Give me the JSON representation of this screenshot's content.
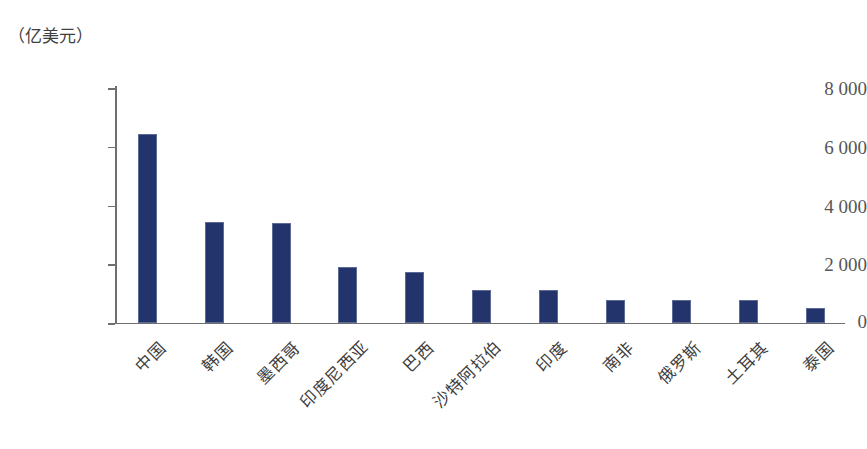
{
  "chart_data": {
    "type": "bar",
    "title": "",
    "subtitle": "",
    "unit_label": "（亿美元）",
    "xlabel": "",
    "ylabel": "",
    "ylim": [
      0,
      8000
    ],
    "yticks": [
      "0",
      "2 000",
      "4 000",
      "6 000",
      "8 000"
    ],
    "ytick_values": [
      0,
      2000,
      4000,
      6000,
      8000
    ],
    "grid": false,
    "legend": false,
    "bar_color": "#22346b",
    "axis_color": "#6f6f6f",
    "categories": [
      "中国",
      "韩国",
      "墨西哥",
      "印度尼西亚",
      "巴西",
      "沙特阿拉伯",
      "印度",
      "南非",
      "俄罗斯",
      "土耳其",
      "泰国"
    ],
    "values": [
      6450,
      3440,
      3410,
      1900,
      1740,
      1130,
      1130,
      790,
      800,
      780,
      520
    ],
    "series": [
      {
        "name": "",
        "values": [
          6450,
          3440,
          3410,
          1900,
          1740,
          1130,
          1130,
          790,
          800,
          780,
          520
        ]
      }
    ]
  }
}
